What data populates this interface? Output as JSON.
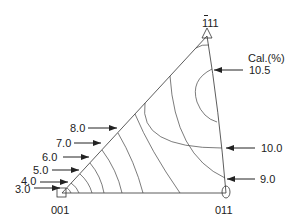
{
  "figure": {
    "type": "inverse pole figure (stereographic triangle) with contour map",
    "poles": {
      "top": {
        "label": "111",
        "overbar_on_first_digit": true,
        "marker": "triangle"
      },
      "bottom_left": {
        "label": "001",
        "marker": "square"
      },
      "bottom_right": {
        "label": "011",
        "marker": "ellipse"
      }
    },
    "legend_title": "Cal.(%)",
    "contour_labels_left": [
      "8.0",
      "7.0",
      "6.0",
      "5.0",
      "4.0",
      "3.0"
    ],
    "contour_labels_right": [
      "10.5",
      "10.0",
      "9.0"
    ],
    "line_color": "#222222",
    "background": "#ffffff"
  },
  "labels": {
    "pole_111_digits": "111",
    "pole_001": "001",
    "pole_011": "011",
    "cal": "Cal.(%)",
    "v105": "10.5",
    "v100": "10.0",
    "v90": "9.0",
    "v80": "8.0",
    "v70": "7.0",
    "v60": "6.0",
    "v50": "5.0",
    "v40": "4.0",
    "v30": "3.0"
  }
}
